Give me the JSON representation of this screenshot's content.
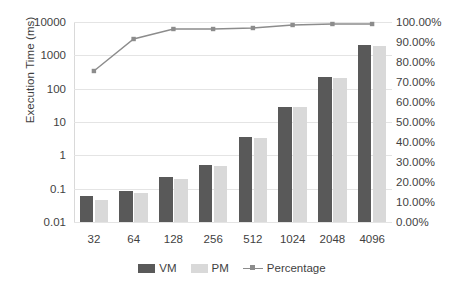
{
  "chart_data": {
    "type": "bar",
    "title": "",
    "xlabel": "",
    "ylabel": "Execution Time (ms)",
    "y2label": "",
    "categories": [
      "32",
      "64",
      "128",
      "256",
      "512",
      "1024",
      "2048",
      "4096"
    ],
    "yscale": "log",
    "ylim": [
      0.01,
      10000
    ],
    "ytick_labels": [
      "10000",
      "1000",
      "100",
      "10",
      "1",
      "0.1",
      "0.01"
    ],
    "ytick_values": [
      10000,
      1000,
      100,
      10,
      1,
      0.1,
      0.01
    ],
    "y2lim": [
      0,
      1
    ],
    "y2tick_labels": [
      "100.00%",
      "90.00%",
      "80.00%",
      "70.00%",
      "60.00%",
      "50.00%",
      "40.00%",
      "30.00%",
      "20.00%",
      "10.00%",
      "0.00%"
    ],
    "y2tick_values": [
      1.0,
      0.9,
      0.8,
      0.7,
      0.6,
      0.5,
      0.4,
      0.3,
      0.2,
      0.1,
      0.0
    ],
    "grid": true,
    "legend_position": "bottom",
    "series": [
      {
        "name": "VM",
        "type": "bar",
        "axis": "left",
        "color": "#595959",
        "values": [
          0.062,
          0.085,
          0.22,
          0.5,
          3.6,
          29,
          220,
          2000
        ]
      },
      {
        "name": "PM",
        "type": "bar",
        "axis": "left",
        "color": "#d9d9d9",
        "values": [
          0.046,
          0.072,
          0.2,
          0.48,
          3.4,
          28,
          210,
          1850
        ]
      },
      {
        "name": "Percentage",
        "type": "line",
        "axis": "right",
        "color": "#8c8c8c",
        "values": [
          0.755,
          0.915,
          0.965,
          0.965,
          0.97,
          0.985,
          0.99,
          0.99
        ]
      }
    ]
  },
  "legend": {
    "items": [
      {
        "label": "VM",
        "color": "#595959",
        "marker": "square"
      },
      {
        "label": "PM",
        "color": "#d9d9d9",
        "marker": "square"
      },
      {
        "label": "Percentage",
        "color": "#8c8c8c",
        "marker": "line"
      }
    ]
  },
  "colors": {
    "vm": "#595959",
    "pm": "#d9d9d9",
    "line": "#8c8c8c",
    "grid": "#e4e4e4",
    "text": "#3f3f3f",
    "background": "#ffffff"
  }
}
